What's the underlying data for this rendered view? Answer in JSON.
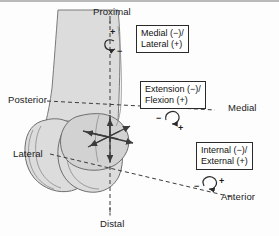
{
  "figure": {
    "background_color": "#fdfdfd",
    "bone_fill": "#dcdcdc",
    "bone_outline": "#6e6e6e",
    "axis_color": "#3b3b3b",
    "border_color": "#b9b9b9"
  },
  "axis_labels": {
    "proximal": "Proximal",
    "distal": "Distal",
    "medial": "Medial",
    "lateral": "Lateral",
    "anterior": "Anterior",
    "posterior": "Posterior"
  },
  "callouts": [
    {
      "id": "longitudinal-rotation",
      "line1": "Medial (−)/",
      "line2": "Lateral (+)",
      "positive_sign": "+",
      "negative_sign": "−"
    },
    {
      "id": "flexion-extension",
      "line1": "Extension (−)/",
      "line2": "Flexion (+)",
      "positive_sign": "+",
      "negative_sign": "−"
    },
    {
      "id": "axial-rotation",
      "line1": "Internal (−)/",
      "line2": "External (+)",
      "positive_sign": "+",
      "negative_sign": "−"
    }
  ]
}
